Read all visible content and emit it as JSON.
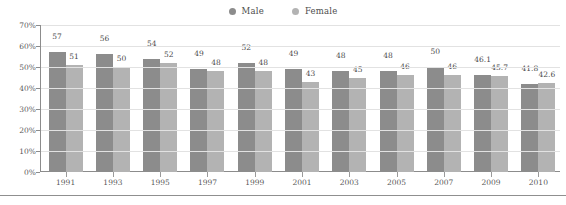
{
  "chart_data": {
    "type": "bar",
    "title": "",
    "xlabel": "",
    "ylabel": "",
    "ylim": [
      0,
      70
    ],
    "ytick_labels": [
      "0%",
      "10%",
      "20%",
      "30%",
      "40%",
      "50%",
      "60%",
      "70%"
    ],
    "ytick_values": [
      0,
      10,
      20,
      30,
      40,
      50,
      60,
      70
    ],
    "grid": true,
    "legend_position": "top-center",
    "categories": [
      "1991",
      "1993",
      "1995",
      "1997",
      "1999",
      "2001",
      "2003",
      "2005",
      "2007",
      "2009",
      "2010"
    ],
    "series": [
      {
        "name": "Male",
        "color": "#8c8c8c",
        "values": [
          57,
          56,
          54,
          49,
          52,
          49,
          48,
          48,
          50,
          46.1,
          41.8
        ],
        "labels": [
          "57",
          "56",
          "54",
          "49",
          "52",
          "49",
          "48",
          "48",
          "50",
          "46.1",
          "41.8"
        ]
      },
      {
        "name": "Female",
        "color": "#b3b3b3",
        "values": [
          51,
          50,
          52,
          48,
          48,
          43,
          45,
          46,
          46,
          45.7,
          42.6
        ],
        "labels": [
          "51",
          "50",
          "52",
          "48",
          "48",
          "43",
          "45",
          "46",
          "46",
          "45.7",
          "42.6"
        ]
      }
    ]
  },
  "legend": {
    "items": [
      {
        "label": "Male",
        "color": "#8c8c8c",
        "icon": "circle-dot-icon"
      },
      {
        "label": "Female",
        "color": "#b3b3b3",
        "icon": "circle-dot-icon"
      }
    ]
  },
  "colors": {
    "male": "#8c8c8c",
    "female": "#b3b3b3",
    "axis": "#8c8c8c",
    "grid": "#e2e2e2",
    "text": "#5a5a5a",
    "background": "#ffffff"
  }
}
